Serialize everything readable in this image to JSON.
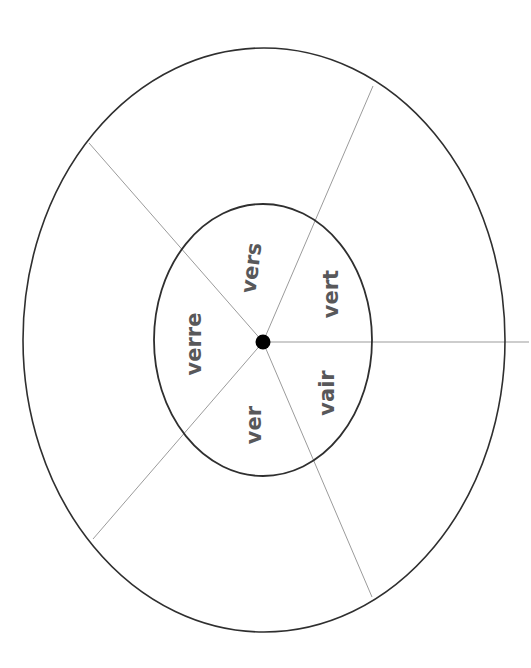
{
  "figure": {
    "type": "radial-sector-diagram",
    "background_color": "#ffffff",
    "outer_ellipse": {
      "name": "outer-ring-boundary",
      "cx": 264,
      "cy": 340,
      "rx": 241,
      "ry": 292,
      "stroke_color": "#2f2f2f",
      "stroke_width": 1.6,
      "fill": "none"
    },
    "inner_ellipse": {
      "name": "inner-ring-boundary",
      "cx": 263,
      "cy": 340,
      "rx": 109,
      "ry": 136,
      "stroke_color": "#2f2f2f",
      "stroke_width": 1.8,
      "fill": "none"
    },
    "hub": {
      "name": "center-node",
      "cx": 263,
      "cy": 342,
      "r": 7.5,
      "fill_color": "#000000"
    },
    "spoke_color": "#9b9b9b",
    "spoke_width": 1.0,
    "spokes": [
      {
        "id": "spoke-upper-left",
        "x2": 89,
        "y2": 143
      },
      {
        "id": "spoke-upper-right",
        "x2": 373,
        "y2": 86
      },
      {
        "id": "spoke-right",
        "x2": 529,
        "y2": 342
      },
      {
        "id": "spoke-lower-right",
        "x2": 372,
        "y2": 597
      },
      {
        "id": "spoke-lower-left",
        "x2": 93,
        "y2": 539
      }
    ]
  },
  "labels": {
    "text_color": "#58585a",
    "items": [
      {
        "id": "sector-label-vers",
        "text": "vers",
        "left": 252,
        "top": 268,
        "rotate": -83,
        "font_size": 21
      },
      {
        "id": "sector-label-vert",
        "text": "vert",
        "left": 331,
        "top": 294,
        "rotate": -90,
        "font_size": 21
      },
      {
        "id": "sector-label-vair",
        "text": "vair",
        "left": 327,
        "top": 393,
        "rotate": -90,
        "font_size": 21
      },
      {
        "id": "sector-label-ver",
        "text": "ver",
        "left": 254,
        "top": 425,
        "rotate": -90,
        "font_size": 21
      },
      {
        "id": "sector-label-verre",
        "text": "verre",
        "left": 194,
        "top": 344,
        "rotate": -90,
        "font_size": 21
      }
    ]
  }
}
